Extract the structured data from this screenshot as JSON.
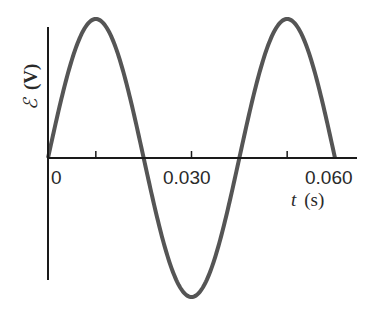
{
  "chart_data": {
    "type": "line",
    "title": "",
    "xlabel": "t (s)",
    "xlabel_var": "t",
    "xlabel_unit": "(s)",
    "ylabel": "ℰ (V)",
    "ylabel_var": "ℰ",
    "ylabel_unit": "(V)",
    "xlim": [
      0,
      0.062
    ],
    "x_tick_labels": [
      "0",
      "0.030",
      "0.060"
    ],
    "x_ticks": [
      0.01,
      0.03,
      0.05
    ],
    "y_ticks": [],
    "grid": false,
    "legend": null,
    "series": [
      {
        "name": "emf",
        "function": "sine",
        "amplitude": 1,
        "period": 0.04,
        "x": [
          0,
          0.01,
          0.02,
          0.03,
          0.04,
          0.05,
          0.06
        ],
        "values": [
          0,
          1,
          0,
          -1,
          0,
          1,
          0
        ]
      }
    ],
    "colors": {
      "curve": "#555555",
      "axes": "#1a1a1a"
    }
  }
}
